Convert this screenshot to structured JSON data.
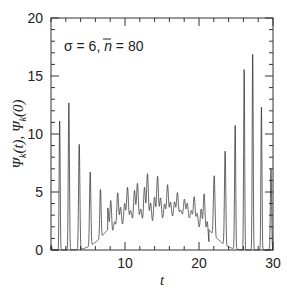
{
  "chart_data": {
    "type": "line",
    "title": "",
    "annotation": "σ = 6, n̄ = 80",
    "annotation_parts": {
      "sigma": "σ = 6, ",
      "nbar_symbol": "n",
      "nbar_value": " = 80"
    },
    "xlabel": "t",
    "ylabel": "Ψk(t), Ψk(0)",
    "xlim": [
      0,
      30
    ],
    "ylim": [
      0,
      20
    ],
    "x_ticks": [
      10,
      20,
      30
    ],
    "y_ticks": [
      0,
      5,
      10,
      15,
      20
    ],
    "x_minor_step": 2,
    "y_minor_step": 1,
    "grid": false,
    "series": [
      {
        "name": "Ψk(t)",
        "description": "rapidly oscillating signal with collapse near t≈12-20 and revivals at both ends",
        "peaks": [
          {
            "t": 1.6,
            "value": 15.3
          },
          {
            "t": 3.0,
            "value": 10.8
          },
          {
            "t": 4.3,
            "value": 8.1
          },
          {
            "t": 5.6,
            "value": 6.3
          },
          {
            "t": 6.9,
            "value": 5.0
          },
          {
            "t": 8.0,
            "value": 4.7
          },
          {
            "t": 9.5,
            "value": 5.2
          },
          {
            "t": 11.0,
            "value": 5.8
          },
          {
            "t": 12.5,
            "value": 6.6
          },
          {
            "t": 13.5,
            "value": 6.9
          },
          {
            "t": 15.0,
            "value": 6.0
          },
          {
            "t": 16.5,
            "value": 5.3
          },
          {
            "t": 18.0,
            "value": 4.6
          },
          {
            "t": 19.5,
            "value": 4.6
          },
          {
            "t": 21.0,
            "value": 5.0
          },
          {
            "t": 22.2,
            "value": 6.6
          },
          {
            "t": 23.4,
            "value": 8.4
          },
          {
            "t": 24.6,
            "value": 9.6
          },
          {
            "t": 25.6,
            "value": 13.6
          },
          {
            "t": 26.8,
            "value": 18.3
          },
          {
            "t": 27.9,
            "value": 15.0
          },
          {
            "t": 29.5,
            "value": 7.0
          }
        ]
      }
    ]
  }
}
